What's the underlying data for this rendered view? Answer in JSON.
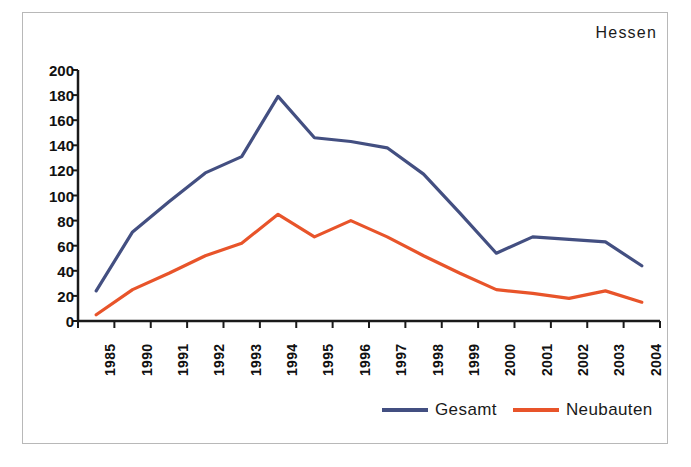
{
  "chart_data": {
    "type": "line",
    "title": "Hessen",
    "xlabel": "",
    "ylabel": "",
    "categories": [
      "1985",
      "1990",
      "1991",
      "1992",
      "1993",
      "1994",
      "1995",
      "1996",
      "1997",
      "1998",
      "1999",
      "2000",
      "2001",
      "2002",
      "2003",
      "2004"
    ],
    "series": [
      {
        "name": "Gesamt",
        "color": "#434f81",
        "values": [
          24,
          71,
          95,
          118,
          131,
          179,
          146,
          143,
          138,
          117,
          86,
          54,
          67,
          65,
          63,
          44
        ]
      },
      {
        "name": "Neubauten",
        "color": "#e8542a",
        "values": [
          5,
          25,
          38,
          52,
          62,
          85,
          67,
          80,
          67,
          52,
          38,
          25,
          22,
          18,
          24,
          15
        ]
      }
    ],
    "ylim": [
      0,
      200
    ],
    "yticks": [
      0,
      20,
      40,
      60,
      80,
      100,
      120,
      140,
      160,
      180,
      200
    ],
    "ytick_labels": [
      "0",
      "20",
      "40",
      "60",
      "80",
      "100",
      "120",
      "140",
      "160",
      "180",
      "200"
    ],
    "grid": false,
    "legend_position": "bottom-right",
    "axis_color": "#1a1a1a",
    "frame_color": "#b8b8b8",
    "background": "#ffffff"
  },
  "legend": {
    "entries": [
      {
        "label": "Gesamt",
        "color": "#434f81"
      },
      {
        "label": "Neubauten",
        "color": "#e8542a"
      }
    ]
  }
}
